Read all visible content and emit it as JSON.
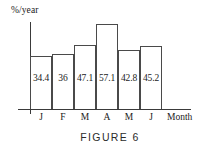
{
  "chart_data": {
    "type": "bar",
    "title": "",
    "caption": "FIGURE 6",
    "xlabel": "Month",
    "ylabel": "%/year",
    "categories": [
      "J",
      "F",
      "M",
      "A",
      "M",
      "J"
    ],
    "values": [
      34.4,
      36,
      47.1,
      57.1,
      42.8,
      45.2
    ],
    "value_labels": [
      "34.4",
      "36",
      "47.1",
      "57.1",
      "42.8",
      "45.2"
    ],
    "grid": false,
    "legend": "none",
    "ylim": [
      0,
      60
    ],
    "axis_note": "bars drawn on a compressed / non-zero baseline scale",
    "bar_pixel_heights": [
      53,
      55,
      64,
      85,
      59,
      63
    ],
    "colors": {
      "background": "#ffffff",
      "bar_outline": "#4a4a4a",
      "axis": "#3a3a3a",
      "text": "#1a1a1a",
      "caption": "#2b2b2b"
    }
  },
  "figure": {
    "caption": "FIGURE 6",
    "y_axis_label": "%/year",
    "x_axis_label": "Month"
  }
}
